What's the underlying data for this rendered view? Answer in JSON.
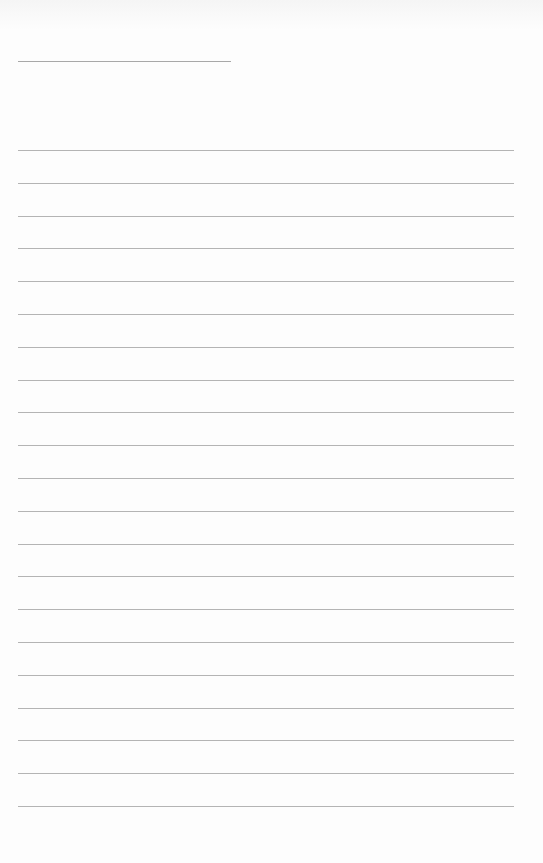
{
  "sheet": {
    "type": "lined-paper",
    "paper_color": "#fdfdfd",
    "line_color": "#b4b4b4",
    "title_line": {
      "x": 18,
      "y": 61,
      "width": 213
    },
    "rules": {
      "x": 18,
      "width": 496,
      "first_y": 150,
      "spacing": 32.8,
      "count": 21
    }
  }
}
